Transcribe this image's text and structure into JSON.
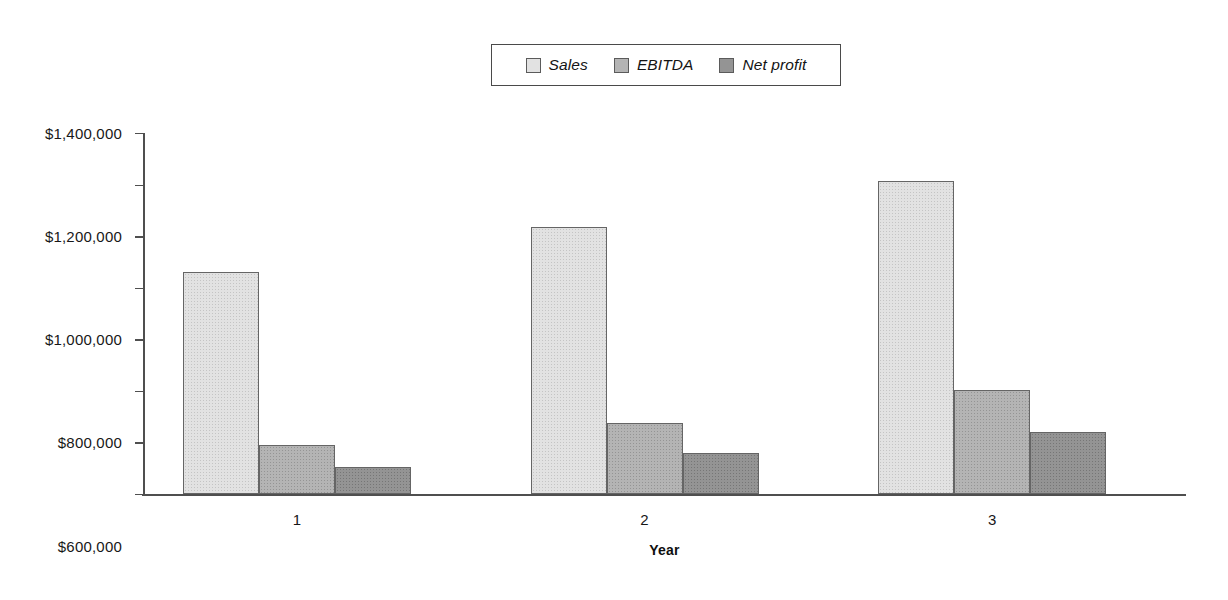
{
  "chart_data": {
    "type": "bar",
    "title": "",
    "subtitle": "",
    "xlabel": "Year",
    "ylabel": "",
    "categories": [
      "1",
      "2",
      "3"
    ],
    "series": [
      {
        "name": "Sales",
        "values": [
          860000,
          1035000,
          1215000
        ],
        "color": "#e2e2e2"
      },
      {
        "name": "EBITDA",
        "values": [
          190000,
          275000,
          405000
        ],
        "color": "#b4b4b4"
      },
      {
        "name": "Net profit",
        "values": [
          105000,
          160000,
          240000
        ],
        "color": "#949494"
      }
    ],
    "ylim": [
      0,
      1400000
    ],
    "ytick_values": [
      0,
      200000,
      400000,
      600000,
      800000,
      1000000,
      1200000,
      1400000
    ],
    "ytick_labels": [
      "$0",
      "$200,000",
      "$400,000",
      "$600,000",
      "$800,000",
      "$1,000,000",
      "$1,200,000",
      "$1,400,000"
    ],
    "grid": false,
    "legend_position": "top-center",
    "legend_border": true,
    "bar_group_gap": true,
    "axis_color": "#4f4f4f"
  },
  "legend": {
    "entries": [
      {
        "label": "Sales"
      },
      {
        "label": "EBITDA"
      },
      {
        "label": "Net profit"
      }
    ]
  },
  "axes": {
    "x_title": "Year"
  }
}
